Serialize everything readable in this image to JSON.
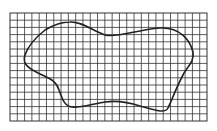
{
  "diagram": {
    "type": "grid-with-closed-curve",
    "grid": {
      "x": 10,
      "y": 13,
      "width": 197,
      "height": 108,
      "columns": 27,
      "rows": 15,
      "line_color": "#333333",
      "background": "#ffffff"
    },
    "shape": {
      "description": "irregular closed blob outline drawn over grid",
      "stroke_color": "#222222",
      "path": "M 70 22 C 80 21, 92 30, 105 35 C 118 38, 135 30, 160 28 C 180 27, 190 40, 193 52 C 195 62, 186 68, 183 75 C 176 88, 172 100, 168 108 C 165 114, 155 110, 140 106 C 128 102, 118 100, 105 102 C 92 104, 80 108, 72 107 C 64 106, 62 98, 59 90 C 56 80, 48 78, 40 74 C 28 68, 22 64, 25 55 C 28 46, 35 38, 45 30 C 55 24, 62 22, 70 22 Z"
    }
  }
}
